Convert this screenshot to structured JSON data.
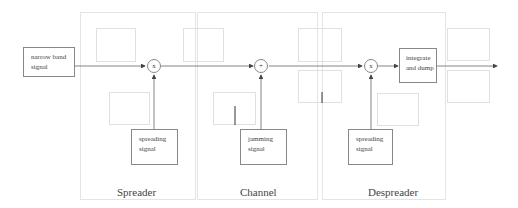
{
  "diagram": {
    "input_block": {
      "label_line1": "narrow band",
      "label_line2": "signal"
    },
    "stages": [
      {
        "name": "Spreader",
        "operator": "x",
        "aux_block": {
          "label_line1": "spreading",
          "label_line2": "signal"
        }
      },
      {
        "name": "Channel",
        "operator": "+",
        "aux_block": {
          "label_line1": "jamming",
          "label_line2": "signal"
        }
      },
      {
        "name": "Despreader",
        "operator": "x",
        "aux_block": {
          "label_line1": "spreading",
          "label_line2": "signal"
        },
        "post_block": {
          "label_line1": "integrate",
          "label_line2": "and dump"
        }
      }
    ],
    "colors": {
      "block_border": "#888888",
      "panel_border": "#e4e4e4",
      "plot_border": "#e0e0e0",
      "wire": "#555555"
    }
  }
}
